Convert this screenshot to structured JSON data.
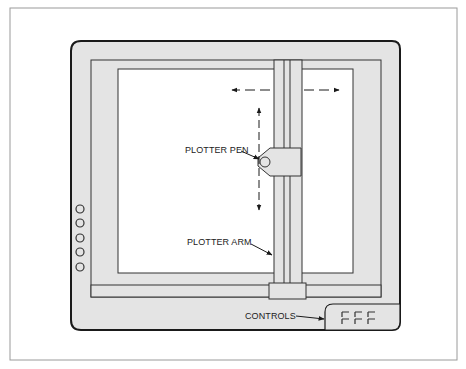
{
  "diagram": {
    "title": "Plotter",
    "labels": {
      "pen": "PLOTTER PEN",
      "arm": "PLOTTER ARM",
      "controls": "CONTROLS"
    },
    "colors": {
      "body_fill": "#e4e4e4",
      "paper_fill": "#ffffff",
      "outline": "#1a1a1a",
      "page_border": "#9a9a9a"
    },
    "components": [
      "plotter-body",
      "paper",
      "plotter-arm",
      "horizontal-rail",
      "carriage",
      "pen-holder",
      "plotter-pen",
      "side-buttons",
      "controls-panel"
    ],
    "motion": {
      "horizontal": "left-right arrows along arm travel",
      "vertical": "up-down arrows along pen travel"
    },
    "side_buttons_count": 5,
    "control_keys_count": 6
  }
}
